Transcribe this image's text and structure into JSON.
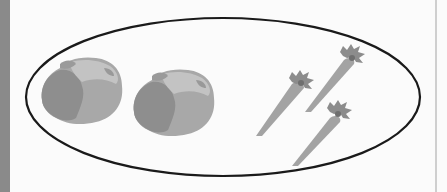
{
  "illustration": {
    "description": "A set (ellipse) containing two cabbages and three carrots",
    "group": {
      "shape": "ellipse",
      "stroke_color": "#1a1a1a",
      "items": [
        {
          "type": "cabbage",
          "count": 2
        },
        {
          "type": "carrot",
          "count": 3
        }
      ]
    },
    "colors": {
      "background": "#fbfbfb",
      "left_strip": "#8a8a8a",
      "cabbage_dark": "#8f8f8f",
      "cabbage_light": "#b8b8b8",
      "carrot_body": "#a3a3a3",
      "carrot_leaves": "#8c8c8c"
    }
  }
}
